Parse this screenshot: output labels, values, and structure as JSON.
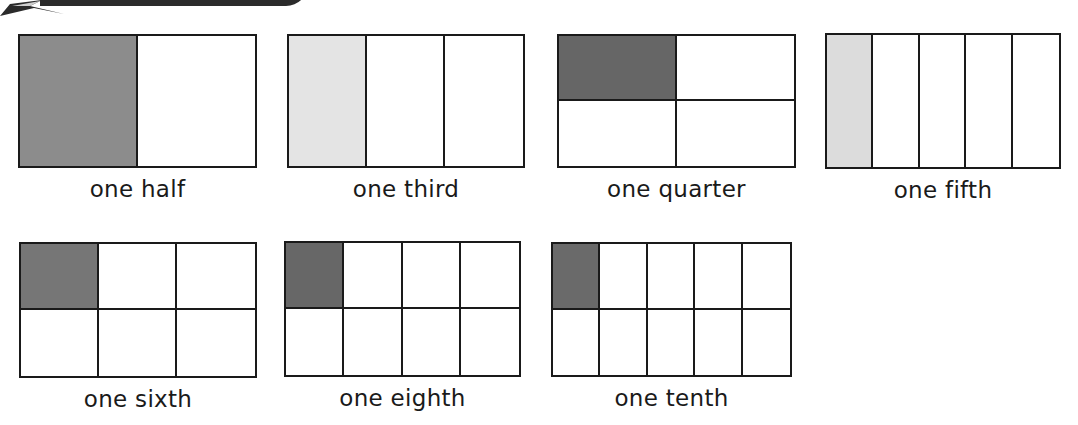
{
  "header": {
    "banner": "partial-title-banner"
  },
  "colors": {
    "line": "#1a1a1a",
    "shade_light": "#e4e4e4",
    "background": "#ffffff"
  },
  "fractions": [
    {
      "label": "one half",
      "rows": 1,
      "cols": 2,
      "shaded": "#8c8c8c",
      "x": 18,
      "y": 34,
      "w": 239,
      "h": 134
    },
    {
      "label": "one third",
      "rows": 1,
      "cols": 3,
      "shaded": "#e4e4e4",
      "x": 287,
      "y": 34,
      "w": 238,
      "h": 134
    },
    {
      "label": "one quarter",
      "rows": 2,
      "cols": 2,
      "shaded": "#666666",
      "x": 557,
      "y": 34,
      "w": 239,
      "h": 134
    },
    {
      "label": "one fifth",
      "rows": 1,
      "cols": 5,
      "shaded": "#dcdcdc",
      "x": 825,
      "y": 33,
      "w": 236,
      "h": 136
    },
    {
      "label": "one sixth",
      "rows": 2,
      "cols": 3,
      "shaded": "#767676",
      "x": 19,
      "y": 242,
      "w": 238,
      "h": 136
    },
    {
      "label": "one eighth",
      "rows": 2,
      "cols": 4,
      "shaded": "#676767",
      "x": 284,
      "y": 241,
      "w": 237,
      "h": 136
    },
    {
      "label": "one tenth",
      "rows": 2,
      "cols": 5,
      "shaded": "#6a6a6a",
      "x": 551,
      "y": 242,
      "w": 241,
      "h": 135
    }
  ]
}
